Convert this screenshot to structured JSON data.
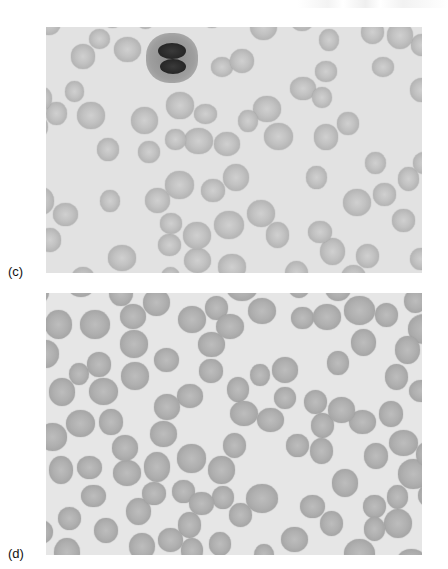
{
  "figure": {
    "header_fragment": "",
    "panels": [
      {
        "id": "c",
        "label": "(c)",
        "description": "Peripheral blood smear micrograph with red blood cells and one neutrophil with a lobed nucleus",
        "features": [
          "red-blood-cells",
          "neutrophil"
        ]
      },
      {
        "id": "d",
        "label": "(d)",
        "description": "Peripheral blood smear micrograph with densely packed red blood cells",
        "features": [
          "red-blood-cells"
        ]
      }
    ]
  },
  "colors": {
    "page_background": "#ffffff",
    "smear_background_c": "#e2e2e2",
    "smear_background_d": "#e6e6e6",
    "rbc_tone": "#b0b0b0",
    "nucleus_tone": "#2a2a2a",
    "label_text": "#111111"
  }
}
